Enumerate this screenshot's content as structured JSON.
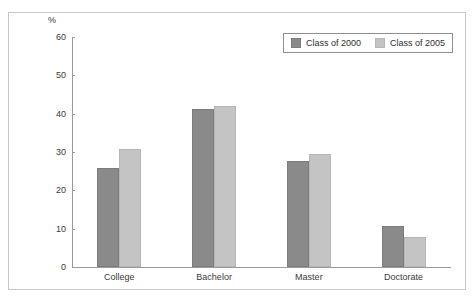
{
  "figure": {
    "title_fragment": "",
    "background_color": "#ffffff",
    "frame_color": "#c8c8c8"
  },
  "legend": {
    "position": "top-right",
    "entries": [
      {
        "label": "Class of 2000",
        "color": "#8a8a8a"
      },
      {
        "label": "Class of 2005",
        "color": "#c4c4c4"
      }
    ]
  },
  "axes": {
    "y_unit_label": "%",
    "y_ticks": [
      "60",
      "50",
      "40",
      "30",
      "20",
      "10",
      "0"
    ],
    "x_tick_labels": [
      "College",
      "Bachelor",
      "Master",
      "Doctorate"
    ]
  },
  "chart_data": {
    "type": "bar",
    "title": "",
    "xlabel": "",
    "ylabel": "%",
    "ylim": [
      0,
      60
    ],
    "yticks": [
      0,
      10,
      20,
      30,
      40,
      50,
      60
    ],
    "grid": false,
    "legend_position": "top-right",
    "categories": [
      "College",
      "Bachelor",
      "Master",
      "Doctorate"
    ],
    "series": [
      {
        "name": "Class of 2000",
        "color": "#8a8a8a",
        "values": [
          25.9,
          41.1,
          27.7,
          10.7
        ]
      },
      {
        "name": "Class of 2005",
        "color": "#c4c4c4",
        "values": [
          30.7,
          42.1,
          29.6,
          7.9
        ]
      }
    ]
  }
}
